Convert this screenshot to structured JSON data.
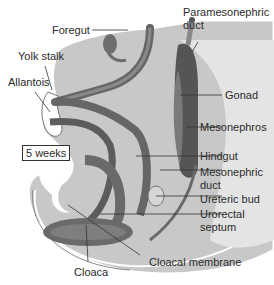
{
  "diagram": {
    "stage_label": "5 weeks",
    "labels": {
      "foregut": "Foregut",
      "yolk_stalk": "Yolk stalk",
      "allantois": "Allantois",
      "paramesonephric_duct_1": "Paramesonephric",
      "paramesonephric_duct_2": "duct",
      "gonad": "Gonad",
      "mesonephros": "Mesonephros",
      "hindgut": "Hindgut",
      "mesonephric_duct_1": "Mesonephric",
      "mesonephric_duct_2": "duct",
      "ureteric_bud": "Ureteric bud",
      "urorectal_septum_1": "Urorectal",
      "urorectal_septum_2": "septum",
      "cloaca": "Cloaca",
      "cloacal_membrane": "Cloacal membrane"
    },
    "colors": {
      "background": "#ffffff",
      "embryo_fill": "#c4c4c4",
      "tube_fill": "#6f6f6f",
      "tube_dark": "#4a4a4a",
      "light_fill": "#e2e2e2",
      "leader": "#333333"
    }
  }
}
